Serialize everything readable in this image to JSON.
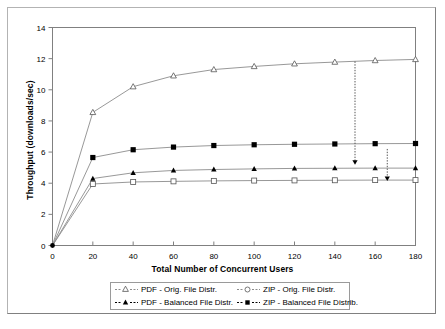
{
  "chart_data": {
    "type": "line",
    "title": "",
    "xlabel": "Total Number of Concurrent Users",
    "ylabel": "Throughput (downloads/sec)",
    "xlim": [
      0,
      180
    ],
    "ylim": [
      0,
      14
    ],
    "xticks": [
      0,
      20,
      40,
      60,
      80,
      100,
      120,
      140,
      160,
      180
    ],
    "yticks": [
      0,
      2,
      4,
      6,
      8,
      10,
      12,
      14
    ],
    "grid": false,
    "legend_position": "bottom",
    "x": [
      0,
      20,
      40,
      60,
      80,
      100,
      120,
      140,
      160,
      180
    ],
    "series": [
      {
        "name": "PDF - Orig. File Distr.",
        "marker": "open-triangle",
        "color": "#555555",
        "values": [
          0,
          8.55,
          10.2,
          10.9,
          11.3,
          11.5,
          11.67,
          11.78,
          11.88,
          11.95
        ]
      },
      {
        "name": "ZIP - Orig. File Distr.",
        "marker": "open-square",
        "color": "#555555",
        "values": [
          0,
          3.95,
          4.08,
          4.12,
          4.15,
          4.17,
          4.18,
          4.19,
          4.2,
          4.2
        ]
      },
      {
        "name": "PDF - Balanced File Distr.",
        "marker": "filled-triangle",
        "color": "#000000",
        "values": [
          0,
          4.3,
          4.67,
          4.82,
          4.88,
          4.92,
          4.95,
          4.96,
          4.97,
          4.97
        ]
      },
      {
        "name": "ZIP - Balanced File Distrib.",
        "marker": "filled-square",
        "color": "#000000",
        "values": [
          0,
          5.65,
          6.15,
          6.32,
          6.42,
          6.47,
          6.5,
          6.52,
          6.54,
          6.55
        ]
      }
    ],
    "annotations": [
      {
        "name": "arrow-pdf-orig-to-zip-balanced",
        "style": "dashed-arrow-down",
        "x": 150,
        "y_from": 11.82,
        "y_to": 5.25
      },
      {
        "name": "arrow-pdf-balanced-to-zip-orig",
        "style": "dashed-arrow-down",
        "x": 166,
        "y_from": 6.2,
        "y_to": 4.2
      }
    ]
  },
  "legend": {
    "entries": [
      {
        "label": "PDF - Orig. File Distr.",
        "marker": "open-triangle"
      },
      {
        "label": "ZIP - Orig. File Distr.",
        "marker": "open-circle"
      },
      {
        "label": "PDF - Balanced File Distr.",
        "marker": "filled-triangle"
      },
      {
        "label": "ZIP - Balanced File Distrib.",
        "marker": "filled-square"
      }
    ]
  },
  "axes": {
    "x_title": "Total Number of Concurrent Users",
    "y_title": "Throughput (downloads/sec)",
    "x_tick_labels": [
      "0",
      "20",
      "40",
      "60",
      "80",
      "100",
      "120",
      "140",
      "160",
      "180"
    ],
    "y_tick_labels": [
      "0",
      "2",
      "4",
      "6",
      "8",
      "10",
      "12",
      "14"
    ]
  },
  "colors": {
    "frame": "#808080",
    "axis": "#808080",
    "line_light": "#8c8c8c",
    "line_dark": "#000000",
    "background": "#ffffff"
  }
}
